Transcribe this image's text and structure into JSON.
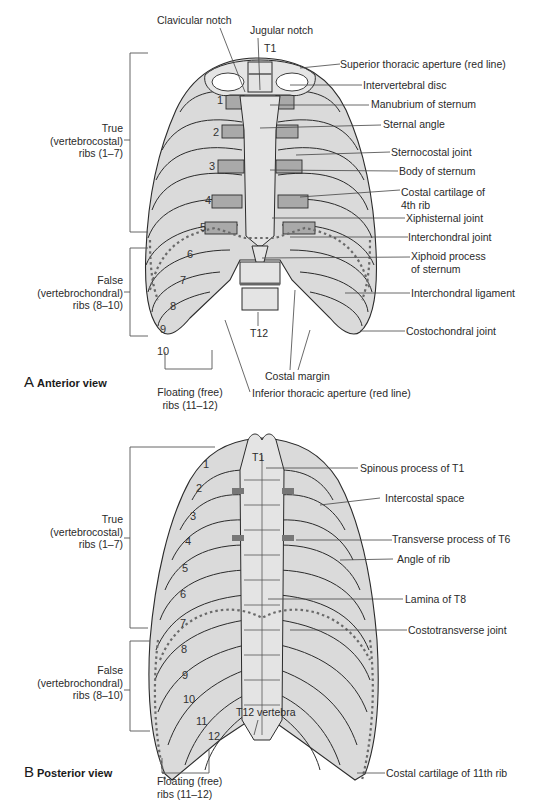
{
  "figure": {
    "anterior": {
      "view_letter": "A",
      "view_title": "Anterior view",
      "top_labels": {
        "clavicular_notch": "Clavicular notch",
        "jugular_notch": "Jugular notch",
        "t1": "T1"
      },
      "right_labels": [
        "Superior thoracic aperture (red line)",
        "Intervertebral disc",
        "Manubrium of sternum",
        "Sternal angle",
        "Sternocostal joint",
        "Body of sternum",
        "Costal cartilage of\n4th rib",
        "Xiphisternal joint",
        "Interchondral joint",
        "Xiphoid process\nof sternum",
        "Interchondral ligament",
        "Costochondral joint"
      ],
      "left_brackets": {
        "true_ribs": "True\n(vertebrocostal)\nribs (1–7)",
        "false_ribs": "False\n(vertebrochondral)\nribs (8–10)"
      },
      "bottom_labels": {
        "t12": "T12",
        "costal_margin": "Costal margin",
        "floating_ribs": "Floating (free)\nribs (11–12)",
        "inferior_aperture": "Inferior thoracic aperture (red line)"
      },
      "rib_numbers": [
        "1",
        "2",
        "3",
        "4",
        "5",
        "6",
        "7",
        "8",
        "9",
        "10"
      ]
    },
    "posterior": {
      "view_letter": "B",
      "view_title": "Posterior view",
      "top_labels": {
        "t1": "T1"
      },
      "right_labels": [
        "Spinous process of T1",
        "Intercostal space",
        "Transverse process of T6",
        "Angle of rib",
        "Lamina of T8",
        "Costotransverse joint",
        "Costal cartilage of 11th rib"
      ],
      "left_brackets": {
        "true_ribs": "True\n(vertebrocostal)\nribs (1–7)",
        "false_ribs": "False\n(vertebrochondral)\nribs (8–10)"
      },
      "bottom_labels": {
        "t12_vertebra": "T12 vertebra",
        "floating_ribs": "Floating (free)\nribs (11–12)"
      },
      "rib_numbers": [
        "1",
        "2",
        "3",
        "4",
        "5",
        "6",
        "7",
        "8",
        "9",
        "10",
        "11",
        "12"
      ]
    },
    "colors": {
      "bone": "#e4e4e4",
      "rib": "#dadada",
      "cartilage": "#a9a9a9",
      "outline": "#2b2b2b",
      "aperture_line": "#6a6a6a"
    }
  }
}
